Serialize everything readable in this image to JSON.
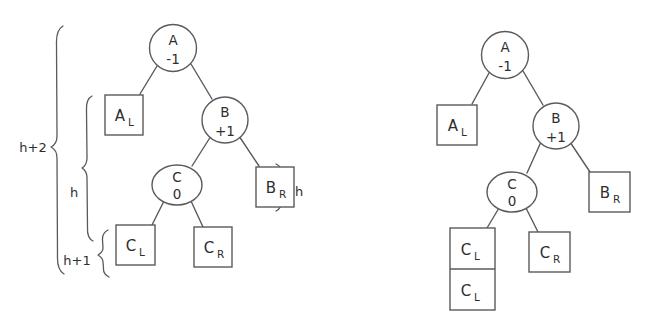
{
  "figure": {
    "background_color": "#ffffff",
    "stroke_color": "#5a5a5a",
    "text_color": "#2e2e2e"
  },
  "left_diagram": {
    "name": "before-rotation-tree",
    "nodes": [
      {
        "id": "A",
        "label": "A",
        "balance": "-1",
        "shape": "circle"
      },
      {
        "id": "B",
        "label": "B",
        "balance": "+1",
        "shape": "circle"
      },
      {
        "id": "C",
        "label": "C",
        "balance": "0",
        "shape": "ellipse"
      }
    ],
    "leaves": [
      {
        "id": "AL",
        "label": "A",
        "subscript": "L",
        "shape": "box"
      },
      {
        "id": "BR",
        "label": "B",
        "subscript": "R",
        "shape": "box"
      },
      {
        "id": "CL",
        "label": "C",
        "subscript": "L",
        "shape": "box"
      },
      {
        "id": "CR",
        "label": "C",
        "subscript": "R",
        "shape": "box"
      }
    ],
    "edges": [
      {
        "from": "A",
        "to": "AL"
      },
      {
        "from": "A",
        "to": "B"
      },
      {
        "from": "B",
        "to": "C"
      },
      {
        "from": "B",
        "to": "BR"
      },
      {
        "from": "C",
        "to": "CL"
      },
      {
        "from": "C",
        "to": "CR"
      }
    ],
    "height_braces": [
      {
        "id": "outer",
        "label": "h+2",
        "side": "left"
      },
      {
        "id": "middle",
        "label": "h",
        "side": "left"
      },
      {
        "id": "inner",
        "label": "h+1",
        "side": "left"
      },
      {
        "id": "br",
        "label": "h",
        "side": "right"
      }
    ]
  },
  "right_diagram": {
    "name": "after-rotation-tree",
    "nodes": [
      {
        "id": "A",
        "label": "A",
        "balance": "-1",
        "shape": "circle"
      },
      {
        "id": "B",
        "label": "B",
        "balance": "+1",
        "shape": "circle"
      },
      {
        "id": "C",
        "label": "C",
        "balance": "0",
        "shape": "ellipse"
      }
    ],
    "leaves": [
      {
        "id": "AL",
        "label": "A",
        "subscript": "L",
        "shape": "box"
      },
      {
        "id": "BR",
        "label": "B",
        "subscript": "R",
        "shape": "box"
      },
      {
        "id": "CL1",
        "label": "C",
        "subscript": "L",
        "shape": "stacked-box-top"
      },
      {
        "id": "CL2",
        "label": "C",
        "subscript": "L",
        "shape": "stacked-box-bottom"
      },
      {
        "id": "CR",
        "label": "C",
        "subscript": "R",
        "shape": "box"
      }
    ],
    "edges": [
      {
        "from": "A",
        "to": "AL"
      },
      {
        "from": "A",
        "to": "B"
      },
      {
        "from": "B",
        "to": "C"
      },
      {
        "from": "B",
        "to": "BR"
      },
      {
        "from": "C",
        "to": "CL1"
      },
      {
        "from": "C",
        "to": "CR"
      }
    ],
    "height_braces": []
  }
}
